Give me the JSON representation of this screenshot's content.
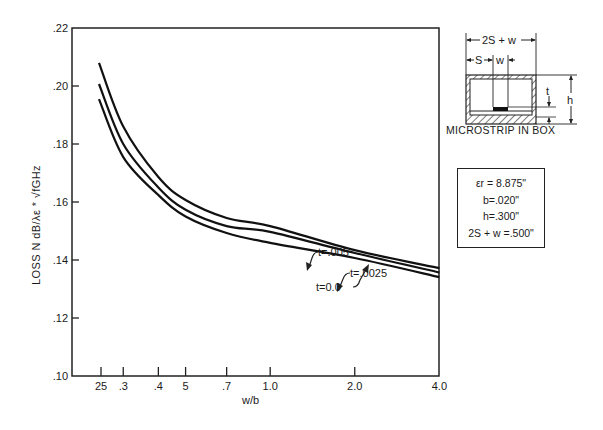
{
  "chart_data": {
    "type": "line",
    "title": "",
    "xlabel": "w/b",
    "ylabel": "LOSS N dB/λε * √fGHz",
    "xscale": "log",
    "xlim": [
      0.25,
      4.0
    ],
    "ylim": [
      0.1,
      0.22
    ],
    "grid": false,
    "x_ticks": [
      0.25,
      0.3,
      0.4,
      0.5,
      0.7,
      1.0,
      2.0,
      4.0
    ],
    "x_tick_labels": [
      "25",
      ".3",
      ".4",
      "5",
      ".7",
      "1.0",
      "2.0",
      "4.0"
    ],
    "y_ticks": [
      0.1,
      0.12,
      0.14,
      0.16,
      0.18,
      0.2,
      0.22
    ],
    "y_tick_labels": [
      ".10",
      ".12",
      ".14",
      ".16",
      ".18",
      ".20",
      ".22"
    ],
    "x": [
      0.25,
      0.3,
      0.4,
      0.5,
      0.7,
      1.0,
      2.0,
      4.0
    ],
    "series": [
      {
        "name": "t=.005",
        "values": [
          0.208,
          0.186,
          0.1686,
          0.1607,
          0.1545,
          0.1517,
          0.1434,
          0.1372
        ]
      },
      {
        "name": "t=.0025",
        "values": [
          0.2007,
          0.18,
          0.165,
          0.1573,
          0.1517,
          0.1497,
          0.1424,
          0.1357
        ]
      },
      {
        "name": "t=0.0",
        "values": [
          0.1955,
          0.1755,
          0.1624,
          0.155,
          0.1493,
          0.1459,
          0.1407,
          0.1341
        ]
      }
    ],
    "annotations": [
      "t=.005",
      "t=.0025",
      "t=0.0"
    ],
    "legend_position": "none"
  },
  "axes": {
    "xlabel": "w/b",
    "ylabel": "LOSS N dB/λε * √fGHz"
  },
  "inset": {
    "caption": "MICROSTRIP IN BOX",
    "dim_total": "2S + w",
    "dim_s": "S",
    "dim_w": "w",
    "dim_t": "t",
    "dim_h": "h"
  },
  "parameters": [
    "εr = 8.875\"",
    "b=.020\"",
    "h=.300\"",
    "2S + w =.500\""
  ]
}
